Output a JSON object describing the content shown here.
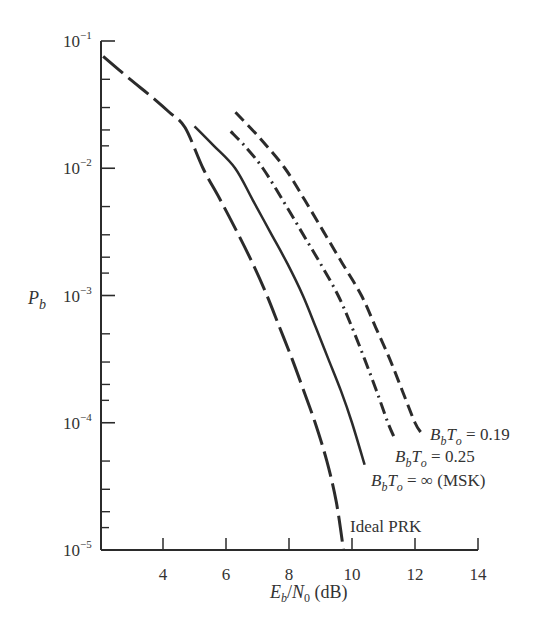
{
  "chart_data": {
    "type": "line",
    "title": "",
    "xlabel": "E_b/N_0 (dB)",
    "ylabel": "P_b",
    "xscale": "linear",
    "yscale": "log",
    "xlim": [
      2.1,
      14
    ],
    "ylim": [
      1e-05,
      0.1
    ],
    "xticks": [
      4,
      6,
      8,
      10,
      12,
      14
    ],
    "xtick_labels": [
      "4",
      "6",
      "8",
      "10",
      "12",
      "14"
    ],
    "yticks": [
      0.1,
      0.01,
      0.001,
      0.0001,
      1e-05
    ],
    "ytick_labels": [
      {
        "base": "10",
        "exp": "−1"
      },
      {
        "base": "10",
        "exp": "−2"
      },
      {
        "base": "10",
        "exp": "−3"
      },
      {
        "base": "10",
        "exp": "−4"
      },
      {
        "base": "10",
        "exp": "−5"
      }
    ],
    "grid": false,
    "legend": "inline annotations at curve ends",
    "series": [
      {
        "name": "Ideal PRK",
        "style": "long-dash",
        "x": [
          2.1,
          2.95,
          3.6,
          4.2,
          4.7,
          5.27,
          5.8,
          6.35,
          6.85,
          7.3,
          7.7,
          8.1,
          8.47,
          8.83,
          9.2,
          9.5,
          9.73
        ],
        "log10_y": [
          -1.12,
          -1.3,
          -1.43,
          -1.56,
          -1.68,
          -2.0,
          -2.24,
          -2.5,
          -2.75,
          -3.0,
          -3.25,
          -3.5,
          -3.75,
          -4.0,
          -4.3,
          -4.62,
          -5.0
        ]
      },
      {
        "name": "B_bT_o = ∞ (MSK)",
        "style": "solid",
        "x": [
          5.0,
          5.6,
          6.29,
          6.85,
          7.4,
          7.95,
          8.44,
          8.85,
          9.25,
          9.65,
          10.0,
          10.4
        ],
        "log10_y": [
          -1.67,
          -1.82,
          -2.0,
          -2.25,
          -2.5,
          -2.75,
          -3.0,
          -3.25,
          -3.5,
          -3.75,
          -4.0,
          -4.33
        ]
      },
      {
        "name": "B_bT_o = 0.25",
        "style": "dash-dot",
        "x": [
          6.15,
          6.65,
          7.17,
          7.8,
          8.4,
          9.0,
          9.56,
          10.0,
          10.4,
          10.78,
          11.14,
          11.35
        ],
        "log10_y": [
          -1.71,
          -1.84,
          -2.0,
          -2.25,
          -2.5,
          -2.75,
          -3.0,
          -3.25,
          -3.5,
          -3.75,
          -4.0,
          -4.12
        ]
      },
      {
        "name": "B_bT_o = 0.19",
        "style": "dashed",
        "x": [
          6.3,
          7.1,
          7.87,
          8.5,
          9.1,
          9.7,
          10.3,
          10.75,
          11.2,
          11.6,
          12.0,
          12.2
        ],
        "log10_y": [
          -1.56,
          -1.77,
          -2.0,
          -2.25,
          -2.5,
          -2.75,
          -3.0,
          -3.25,
          -3.5,
          -3.75,
          -4.0,
          -4.08
        ]
      }
    ],
    "annotations": [
      {
        "text_main": "B",
        "sub1": "b",
        "mid": "T",
        "sub2": "o",
        "rest": " = 0.19",
        "x_px": 430,
        "y_px": 440
      },
      {
        "text_main": "B",
        "sub1": "b",
        "mid": "T",
        "sub2": "o",
        "rest": " = 0.25",
        "x_px": 395,
        "y_px": 462
      },
      {
        "text_main": "B",
        "sub1": "b",
        "mid": "T",
        "sub2": "o",
        "rest": " = ∞ (MSK)",
        "x_px": 371,
        "y_px": 486
      },
      {
        "plain": "Ideal PRK",
        "x_px": 350,
        "y_px": 532
      }
    ]
  },
  "labels": {
    "ylabel_main": "P",
    "ylabel_sub": "b",
    "xlabel_E": "E",
    "xlabel_Esub": "b",
    "xlabel_slash": "/",
    "xlabel_N": "N",
    "xlabel_Nsub": "0",
    "xlabel_unit": " (dB)"
  }
}
